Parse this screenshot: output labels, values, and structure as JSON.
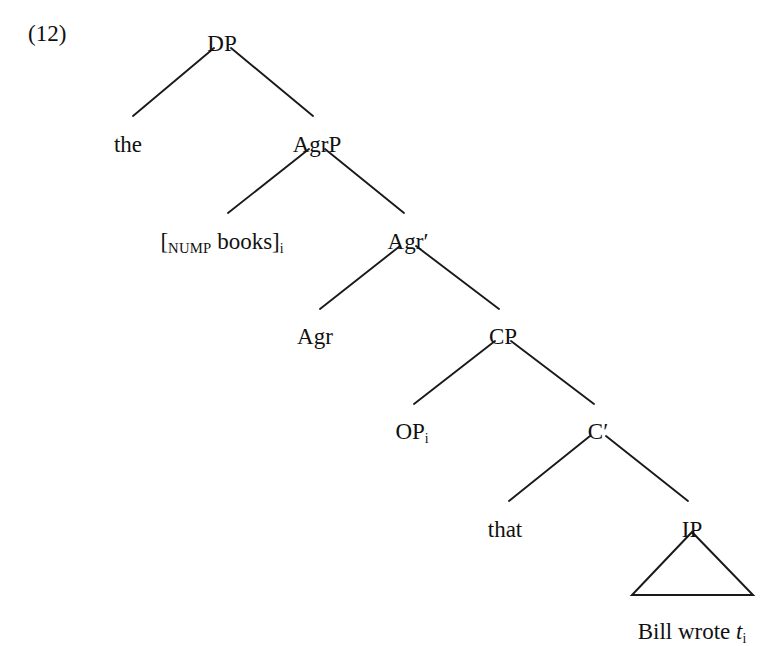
{
  "figure": {
    "example_number": "(12)",
    "type": "syntax-tree"
  },
  "nodes": {
    "dp": {
      "label": "DP",
      "x": 222,
      "y": 32
    },
    "the": {
      "label": "the",
      "x": 128,
      "y": 133
    },
    "agrp": {
      "label": "AgrP",
      "x": 317,
      "y": 133
    },
    "nump": {
      "bracket_open": "[",
      "subscript_label": "NUMP",
      "word": "books",
      "bracket_close": "]",
      "index": "i",
      "x": 222,
      "y": 230
    },
    "agrbar": {
      "label": "Agr",
      "prime": "′",
      "x": 408,
      "y": 230
    },
    "agr": {
      "label": "Agr",
      "x": 315,
      "y": 325
    },
    "cp": {
      "label": "CP",
      "x": 503,
      "y": 325
    },
    "op": {
      "label": "OP",
      "index": "i",
      "x": 412,
      "y": 420
    },
    "cbar": {
      "label": "C",
      "prime": "′",
      "x": 598,
      "y": 420
    },
    "that": {
      "label": "that",
      "x": 505,
      "y": 518
    },
    "ip": {
      "label": "IP",
      "x": 692,
      "y": 518
    },
    "terminal": {
      "text_before": "Bill wrote ",
      "trace": "t",
      "index": "i",
      "x": 692,
      "y": 620
    }
  },
  "branches": [
    {
      "name": "dp-to-the",
      "x1": 214,
      "y1": 48,
      "x2": 133,
      "y2": 116
    },
    {
      "name": "dp-to-agrp",
      "x1": 231,
      "y1": 48,
      "x2": 313,
      "y2": 116
    },
    {
      "name": "agrp-to-nump",
      "x1": 309,
      "y1": 149,
      "x2": 228,
      "y2": 213
    },
    {
      "name": "agrp-to-agrbar",
      "x1": 325,
      "y1": 149,
      "x2": 404,
      "y2": 213
    },
    {
      "name": "agrbar-to-agr",
      "x1": 400,
      "y1": 246,
      "x2": 320,
      "y2": 309
    },
    {
      "name": "agrbar-to-cp",
      "x1": 416,
      "y1": 246,
      "x2": 499,
      "y2": 309
    },
    {
      "name": "cp-to-op",
      "x1": 495,
      "y1": 341,
      "x2": 414,
      "y2": 404
    },
    {
      "name": "cp-to-cbar",
      "x1": 511,
      "y1": 341,
      "x2": 594,
      "y2": 404
    },
    {
      "name": "cbar-to-that",
      "x1": 590,
      "y1": 436,
      "x2": 509,
      "y2": 501
    },
    {
      "name": "cbar-to-ip",
      "x1": 606,
      "y1": 436,
      "x2": 688,
      "y2": 501
    }
  ],
  "triangle": {
    "name": "ip-triangle",
    "apex_x": 692,
    "apex_y": 532,
    "left_x": 632,
    "base_y": 595,
    "right_x": 753
  },
  "colors": {
    "background": "#ffffff",
    "ink": "#111111",
    "line": "#1a1a1a"
  }
}
